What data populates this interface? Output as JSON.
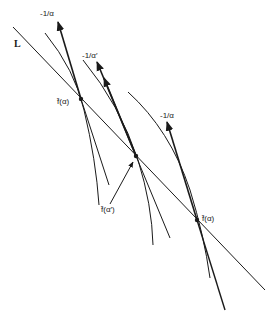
{
  "diagram": {
    "line_label": "L",
    "arrow_labels": [
      "-1/α",
      "-1/α′",
      "-1/α"
    ],
    "point_labels": [
      "f̂(α)",
      "f̂(α′)",
      "f̂(α)"
    ],
    "colors": {
      "stroke": "#1a1a1a",
      "background": "#ffffff"
    }
  }
}
